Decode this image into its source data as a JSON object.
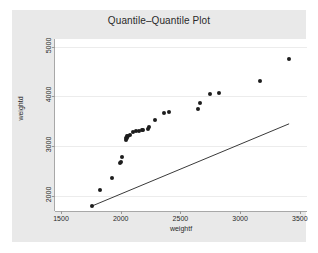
{
  "chart_data": {
    "type": "scatter",
    "title": "Quantile–Quantile Plot",
    "xlabel": "weightf",
    "ylabel": "weightd",
    "xlim": [
      1450,
      3560
    ],
    "ylim": [
      1700,
      5150
    ],
    "xticks": [
      1500,
      2000,
      2500,
      3000,
      3500
    ],
    "yticks": [
      2000,
      3000,
      4000,
      5000
    ],
    "grid": "horizontal",
    "legend": "none",
    "series": [
      {
        "name": "quantile-points",
        "marker": "filled-circle",
        "color": "#1d1d1d",
        "points": [
          [
            1760,
            1800
          ],
          [
            1830,
            2120
          ],
          [
            1930,
            2370
          ],
          [
            1990,
            2660
          ],
          [
            2000,
            2690
          ],
          [
            2010,
            2790
          ],
          [
            2040,
            3130
          ],
          [
            2045,
            3160
          ],
          [
            2050,
            3170
          ],
          [
            2055,
            3200
          ],
          [
            2060,
            3210
          ],
          [
            2075,
            3220
          ],
          [
            2105,
            3290
          ],
          [
            2125,
            3300
          ],
          [
            2150,
            3300
          ],
          [
            2175,
            3320
          ],
          [
            2190,
            3330
          ],
          [
            2225,
            3350
          ],
          [
            2240,
            3390
          ],
          [
            2285,
            3520
          ],
          [
            2360,
            3660
          ],
          [
            2400,
            3690
          ],
          [
            2650,
            3740
          ],
          [
            2665,
            3870
          ],
          [
            2750,
            4040
          ],
          [
            2825,
            4070
          ],
          [
            3170,
            4300
          ],
          [
            3410,
            4750
          ]
        ]
      }
    ],
    "reference_line": {
      "name": "identity-reference-line",
      "color": "#3a3a3a",
      "from": [
        1760,
        1800
      ],
      "to": [
        3410,
        3450
      ]
    }
  },
  "figure": {
    "background": "#e9e9e9",
    "panel_background": "#ffffff",
    "grid_color": "#ececec",
    "axis_color": "#a8a8a8",
    "text_color": "#2a2a2a"
  }
}
